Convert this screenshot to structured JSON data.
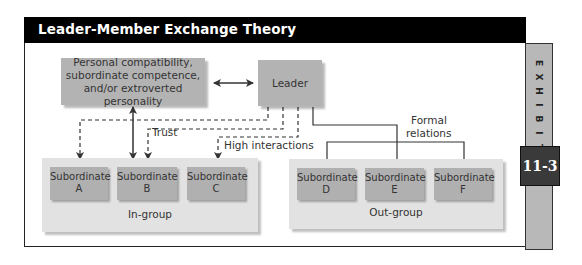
{
  "header": {
    "title": "Leader-Member Exchange Theory"
  },
  "exhibit": {
    "letters": [
      "E",
      "X",
      "H",
      "I",
      "B",
      "I",
      "T"
    ],
    "number": "11-3",
    "colors": {
      "strip": "#b8b8b8",
      "number_box": "#3a3a3a"
    }
  },
  "diagram": {
    "factors_box": {
      "lines": [
        "Personal compatibility,",
        "subordinate competence,",
        "and/or extroverted personality"
      ]
    },
    "leader_box": {
      "label": "Leader"
    },
    "edge_labels": {
      "trust": "Trust",
      "high_interactions": "High interactions",
      "formal_relations_line1": "Formal",
      "formal_relations_line2": "relations"
    },
    "in_group": {
      "label": "In-group",
      "members": [
        {
          "title": "Subordinate",
          "id": "A"
        },
        {
          "title": "Subordinate",
          "id": "B"
        },
        {
          "title": "Subordinate",
          "id": "C"
        }
      ]
    },
    "out_group": {
      "label": "Out-group",
      "members": [
        {
          "title": "Subordinate",
          "id": "D"
        },
        {
          "title": "Subordinate",
          "id": "E"
        },
        {
          "title": "Subordinate",
          "id": "F"
        }
      ]
    },
    "colors": {
      "box_fill": "#b3b3b3",
      "group_fill": "#e2e2e2",
      "line": "#333333"
    }
  }
}
